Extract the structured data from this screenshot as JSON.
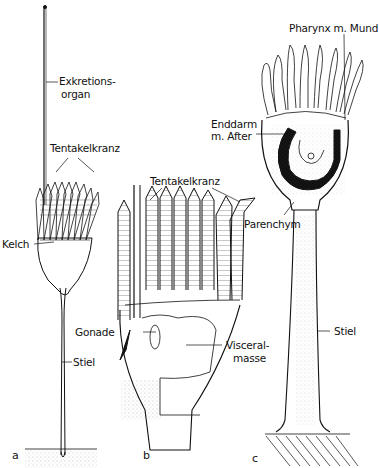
{
  "figure": {
    "panels": [
      "a",
      "b",
      "c"
    ],
    "labels": {
      "a": {
        "exkretions_1": "Exkretions-",
        "exkretions_2": "organ",
        "tentakelkranz": "Tentakelkranz",
        "kelch": "Kelch",
        "stiel": "Stiel"
      },
      "b": {
        "tentakelkranz": "Tentakelkranz",
        "gonade": "Gonade",
        "visceral_1": "Visceral-",
        "visceral_2": "masse"
      },
      "c": {
        "pharynx": "Pharynx m. Mund",
        "enddarm_1": "Enddarm",
        "enddarm_2": "m. After",
        "parenchym": "Parenchym",
        "stiel": "Stiel"
      }
    }
  }
}
